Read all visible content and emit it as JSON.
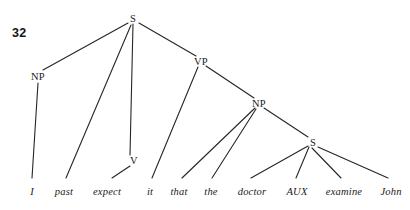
{
  "figure": {
    "number": "32",
    "width": 410,
    "height": 210,
    "background": "#ffffff",
    "line_color": "#262626",
    "text_color": "#1a1a1a"
  },
  "nodes": [
    {
      "id": "S1",
      "label": "S",
      "x": 133,
      "y": 18
    },
    {
      "id": "NP1",
      "label": "NP",
      "x": 38,
      "y": 76
    },
    {
      "id": "VP",
      "label": "VP",
      "x": 201,
      "y": 61
    },
    {
      "id": "NP2",
      "label": "NP",
      "x": 259,
      "y": 103
    },
    {
      "id": "V",
      "label": "V",
      "x": 134,
      "y": 160
    },
    {
      "id": "S2",
      "label": "S",
      "x": 313,
      "y": 142
    }
  ],
  "leaves": [
    {
      "id": "L1",
      "label": "I",
      "x": 32,
      "y": 186
    },
    {
      "id": "L2",
      "label": "past",
      "x": 64,
      "y": 186
    },
    {
      "id": "L3",
      "label": "expect",
      "x": 107,
      "y": 186
    },
    {
      "id": "L4",
      "label": "it",
      "x": 150,
      "y": 186
    },
    {
      "id": "L5",
      "label": "that",
      "x": 179,
      "y": 186
    },
    {
      "id": "L6",
      "label": "the",
      "x": 211,
      "y": 186
    },
    {
      "id": "L7",
      "label": "doctor",
      "x": 252,
      "y": 186
    },
    {
      "id": "L8",
      "label": "AUX",
      "x": 297,
      "y": 186
    },
    {
      "id": "L9",
      "label": "examine",
      "x": 344,
      "y": 186
    },
    {
      "id": "L10",
      "label": "John",
      "x": 391,
      "y": 186
    }
  ],
  "edges": [
    {
      "from": "S1",
      "to": "NP1",
      "x1": 128,
      "y1": 23,
      "x2": 43,
      "y2": 70
    },
    {
      "from": "S1",
      "to": "V",
      "x1": 133,
      "y1": 24,
      "x2": 130,
      "y2": 155
    },
    {
      "from": "S1",
      "to": "VP",
      "x1": 139,
      "y1": 23,
      "x2": 196,
      "y2": 56
    },
    {
      "from": "NP1",
      "to": "L1",
      "x1": 38,
      "y1": 83,
      "x2": 32,
      "y2": 178
    },
    {
      "from": "S1",
      "to": "L2",
      "x1": 131,
      "y1": 25,
      "x2": 66,
      "y2": 178
    },
    {
      "from": "V",
      "to": "L3",
      "x1": 130,
      "y1": 166,
      "x2": 112,
      "y2": 178
    },
    {
      "from": "VP",
      "to": "L4",
      "x1": 198,
      "y1": 67,
      "x2": 152,
      "y2": 178
    },
    {
      "from": "VP",
      "to": "NP2",
      "x1": 206,
      "y1": 66,
      "x2": 254,
      "y2": 98
    },
    {
      "from": "NP2",
      "to": "L5",
      "x1": 255,
      "y1": 108,
      "x2": 182,
      "y2": 178
    },
    {
      "from": "NP2",
      "to": "L6",
      "x1": 256,
      "y1": 109,
      "x2": 212,
      "y2": 178
    },
    {
      "from": "NP2",
      "to": "S2",
      "x1": 264,
      "y1": 108,
      "x2": 308,
      "y2": 137
    },
    {
      "from": "S2",
      "to": "L7",
      "x1": 308,
      "y1": 146,
      "x2": 251,
      "y2": 178
    },
    {
      "from": "S2",
      "to": "L8",
      "x1": 309,
      "y1": 147,
      "x2": 296,
      "y2": 178
    },
    {
      "from": "S2",
      "to": "L9",
      "x1": 312,
      "y1": 148,
      "x2": 341,
      "y2": 178
    },
    {
      "from": "S2",
      "to": "L10",
      "x1": 318,
      "y1": 147,
      "x2": 388,
      "y2": 178
    }
  ]
}
